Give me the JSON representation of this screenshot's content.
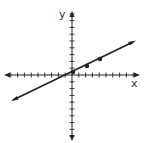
{
  "diagram": {
    "type": "coordinate-plane-with-line",
    "x_axis_label": "x",
    "y_axis_label": "y",
    "ticks_per_side": {
      "left": 9,
      "right": 9,
      "up": 9,
      "down": 9
    },
    "colors": {
      "ink": "#222222",
      "background": "#ffffff"
    }
  },
  "chart_data": {
    "type": "line",
    "title": "",
    "xlabel": "x",
    "ylabel": "y",
    "grid": false,
    "xlim": [
      -9,
      9
    ],
    "ylim": [
      -9,
      9
    ],
    "series": [
      {
        "name": "line",
        "slope": 0.5,
        "intercept": 0.4,
        "points": [
          {
            "x": 0,
            "y": 0.4
          },
          {
            "x": 2,
            "y": 1.3
          },
          {
            "x": 4,
            "y": 2.3
          }
        ]
      }
    ]
  }
}
